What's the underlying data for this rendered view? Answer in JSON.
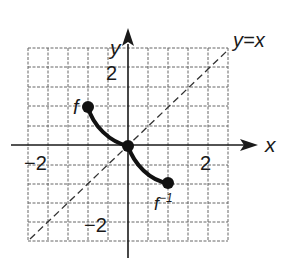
{
  "figure": {
    "type": "function-and-inverse-graph",
    "axes": {
      "x_label": "x",
      "y_label": "y",
      "x_range": [
        -5,
        5
      ],
      "y_range": [
        -5,
        5
      ],
      "grid": true,
      "grid_style": "dashed"
    },
    "tick_labels": {
      "x_neg": "−2",
      "x_pos": "2",
      "y_pos": "2",
      "y_neg": "−2"
    },
    "reference_line": {
      "label": "y=x",
      "style": "dashed"
    },
    "curves": [
      {
        "name": "f",
        "label": "f",
        "start": [
          -2,
          2
        ],
        "end": [
          0,
          0
        ],
        "endpoints": "filled-dots"
      },
      {
        "name": "f_inverse",
        "label": "f",
        "label_superscript": "−1",
        "start": [
          0,
          0
        ],
        "end": [
          2,
          -2
        ],
        "endpoints": "filled-dots"
      }
    ],
    "colors": {
      "ink": "#1a1a1a",
      "grid": "#555555",
      "background": "#ffffff"
    }
  }
}
